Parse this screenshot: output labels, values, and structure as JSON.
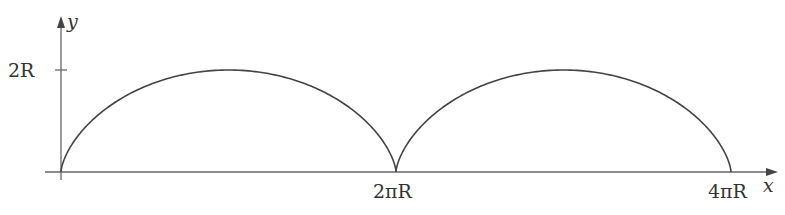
{
  "diagram": {
    "type": "cycloid",
    "axes": {
      "x_label": "x",
      "y_label": "y",
      "y_tick_label": "2R",
      "x_tick_labels": [
        "2πR",
        "4πR"
      ]
    },
    "curve": {
      "description": "Two arches of a cycloid",
      "arches": 2,
      "height": "2R",
      "period": "2πR"
    },
    "colors": {
      "axis": "#555555",
      "curve": "#444444",
      "text": "#333333"
    }
  }
}
